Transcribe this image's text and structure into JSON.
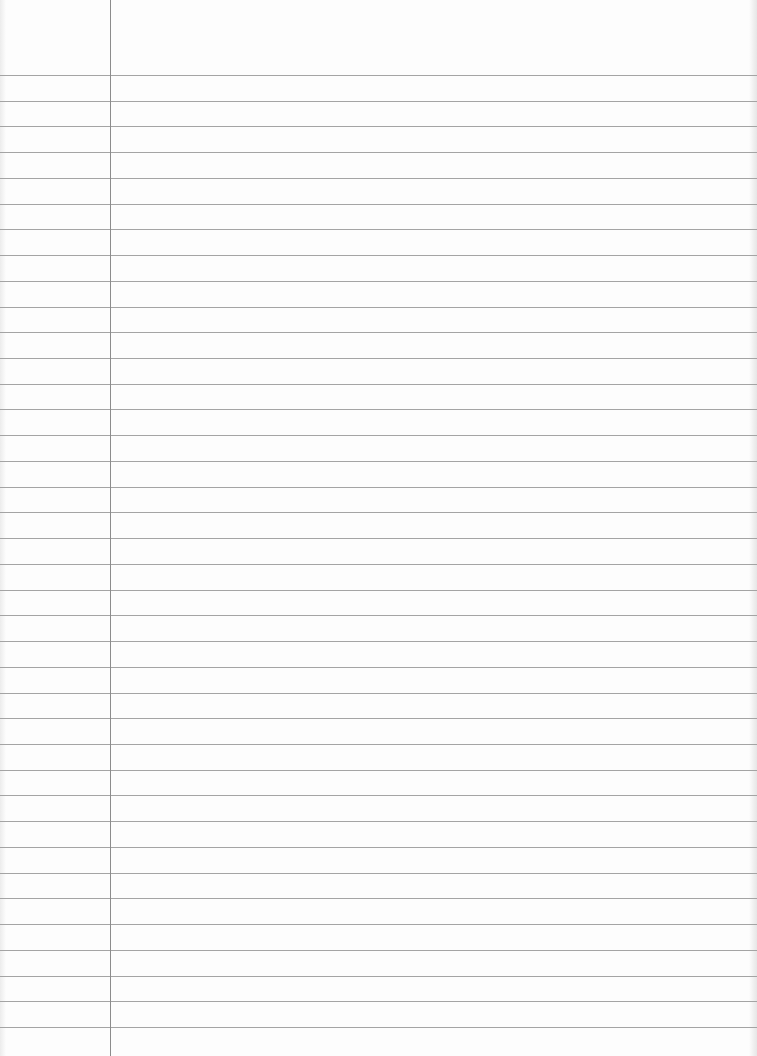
{
  "document": {
    "type": "lined-paper",
    "text_content": "",
    "ruled_line_count": 38,
    "has_margin_line": true,
    "colors": {
      "paper": "#fdfdfd",
      "ruled_line": "#a4a4a4",
      "margin_line": "#8c8c8c"
    }
  }
}
